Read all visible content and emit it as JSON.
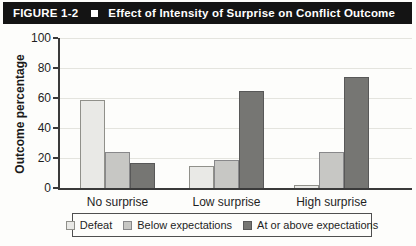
{
  "figure_header": {
    "label": "FIGURE 1-2",
    "title": "Effect of Intensity of Surprise on Conflict Outcome",
    "background": "#141414",
    "text_color": "#ffffff"
  },
  "chart_data": {
    "type": "bar",
    "title": "Effect of Intensity of Surprise on Conflict Outcome",
    "xlabel": "",
    "ylabel": "Outcome percentage",
    "ylim": [
      0,
      100
    ],
    "yticks": [
      0,
      20,
      40,
      60,
      80,
      100
    ],
    "grid": true,
    "legend_position": "bottom",
    "categories": [
      "No surprise",
      "Low surprise",
      "High surprise"
    ],
    "series": [
      {
        "name": "Defeat",
        "fill": "#e9e9e6",
        "border": "#90908a",
        "values": [
          59,
          15,
          2
        ]
      },
      {
        "name": "Below expectations",
        "fill": "#c7c7c4",
        "border": "#88888a",
        "values": [
          24,
          19,
          24
        ]
      },
      {
        "name": "At or above expectations",
        "fill": "#767673",
        "border": "#585858",
        "values": [
          17,
          65,
          74
        ]
      }
    ],
    "axis_color": "#3a3a3a",
    "gridline_color": "#e4e4de"
  }
}
